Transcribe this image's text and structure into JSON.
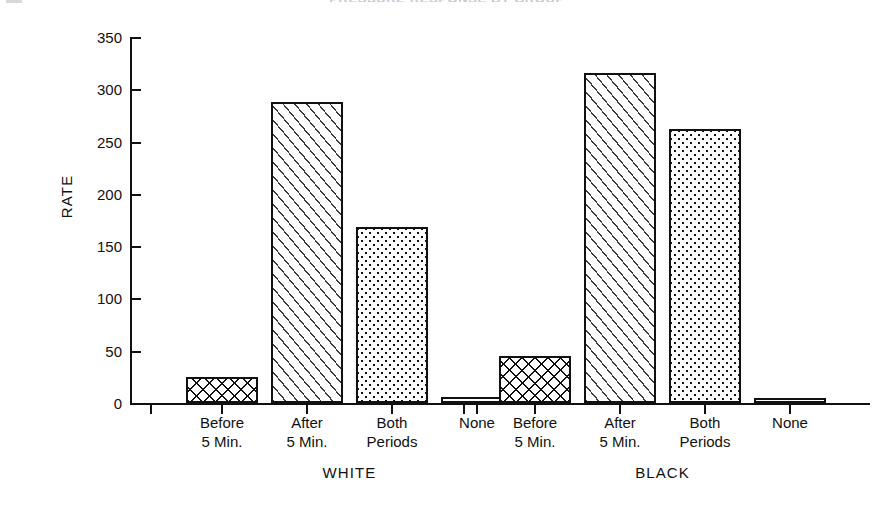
{
  "chart_data": {
    "type": "bar",
    "title": "PRESSURE RESPONSE BY GROUP",
    "xlabel": "",
    "ylabel": "RATE",
    "ylim": [
      0,
      350
    ],
    "yticks": [
      0,
      50,
      100,
      150,
      200,
      250,
      300,
      350
    ],
    "ytick_labels": [
      "0",
      "50",
      "100",
      "150",
      "200",
      "250",
      "300",
      "350"
    ],
    "grid": false,
    "legend": "none",
    "categories": [
      "Before 5 Min.",
      "After 5 Min.",
      "Both Periods",
      "None"
    ],
    "group_labels": [
      "WHITE",
      "BLACK"
    ],
    "groups": [
      {
        "name": "WHITE",
        "bars": [
          {
            "category_line1": "Before",
            "category_line2": "5 Min.",
            "value": 25,
            "pattern": "lattice"
          },
          {
            "category_line1": "After",
            "category_line2": "5 Min.",
            "value": 288,
            "pattern": "diagonal"
          },
          {
            "category_line1": "Both",
            "category_line2": "Periods",
            "value": 168,
            "pattern": "dots"
          },
          {
            "category_line1": "None",
            "category_line2": "",
            "value": 6,
            "pattern": "blank"
          }
        ]
      },
      {
        "name": "BLACK",
        "bars": [
          {
            "category_line1": "Before",
            "category_line2": "5 Min.",
            "value": 45,
            "pattern": "lattice"
          },
          {
            "category_line1": "After",
            "category_line2": "5 Min.",
            "value": 316,
            "pattern": "diagonal"
          },
          {
            "category_line1": "Both",
            "category_line2": "Periods",
            "value": 262,
            "pattern": "dots"
          },
          {
            "category_line1": "None",
            "category_line2": "",
            "value": 5,
            "pattern": "blank"
          }
        ]
      }
    ],
    "colors": {
      "axis": "#111111",
      "bar_outline": "#111111",
      "bar_fill": "#ffffff",
      "text": "#111111"
    }
  }
}
